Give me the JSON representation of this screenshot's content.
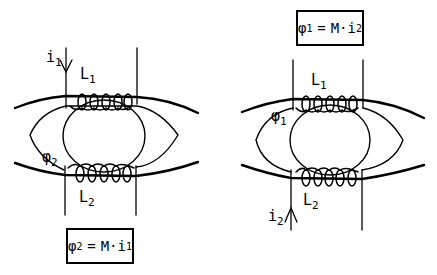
{
  "left_diagram": {
    "current_label": {
      "symbol": "i",
      "subscript": "1",
      "arrow": "down"
    },
    "coil_top_label": {
      "symbol": "L",
      "subscript": "1"
    },
    "flux_label": {
      "symbol": "φ",
      "subscript": "2"
    },
    "coil_bottom_label": {
      "symbol": "L",
      "subscript": "2"
    },
    "equation": {
      "lhs": "φ",
      "lhs_sub": "2",
      "op": "=",
      "rhs": "M·i",
      "rhs_sub": "1"
    }
  },
  "right_diagram": {
    "equation": {
      "lhs": "φ",
      "lhs_sub": "1",
      "op": "=",
      "rhs": "M·i",
      "rhs_sub": "2"
    },
    "coil_top_label": {
      "symbol": "L",
      "subscript": "1"
    },
    "flux_label": {
      "symbol": "φ",
      "subscript": "1"
    },
    "coil_bottom_label": {
      "symbol": "L",
      "subscript": "2"
    },
    "current_label": {
      "symbol": "i",
      "subscript": "2",
      "arrow": "up"
    }
  },
  "colors": {
    "ink": "#000000",
    "background": "#ffffff"
  }
}
